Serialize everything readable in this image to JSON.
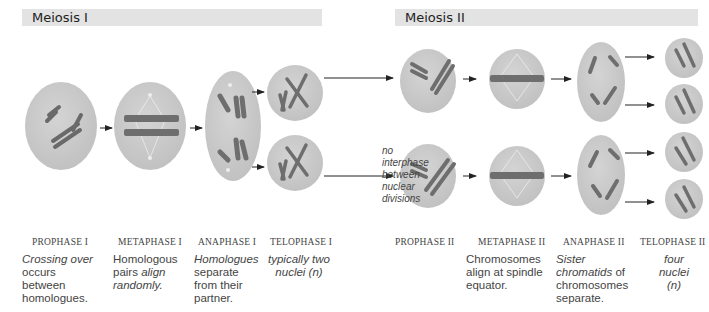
{
  "sections": {
    "meiosis1": {
      "title": "Meiosis I"
    },
    "meiosis2": {
      "title": "Meiosis II"
    }
  },
  "note": {
    "lines": [
      "no",
      "interphase",
      "between",
      "nuclear",
      "divisions"
    ]
  },
  "phases": [
    {
      "name": "PROPHASE I",
      "desc": [
        {
          "t": "Crossing over",
          "i": true
        },
        {
          "t": " occurs between homologues.",
          "i": false
        }
      ]
    },
    {
      "name": "METAPHASE I",
      "desc": [
        {
          "t": "Homologous pairs ",
          "i": false
        },
        {
          "t": "align randomly.",
          "i": true
        }
      ]
    },
    {
      "name": "ANAPHASE I",
      "desc": [
        {
          "t": "Homologues",
          "i": true
        },
        {
          "t": " separate from their partner.",
          "i": false
        }
      ]
    },
    {
      "name": "TELOPHASE I",
      "desc": [
        {
          "t": "typically two nuclei (n)",
          "i": true
        }
      ]
    },
    {
      "name": "PROPHASE II",
      "desc": []
    },
    {
      "name": "METAPHASE II",
      "desc": [
        {
          "t": "Chromosomes align at spindle equator.",
          "i": false
        }
      ]
    },
    {
      "name": "ANAPHASE II",
      "desc": [
        {
          "t": "Sister chromatids",
          "i": true
        },
        {
          "t": " of chromosomes separate.",
          "i": false
        }
      ]
    },
    {
      "name": "TELOPHASE II",
      "desc": [
        {
          "t": "four nuclei (n)",
          "i": true
        }
      ]
    }
  ],
  "colors": {
    "cell_fill": "#c9c9c9",
    "chromosome": "#6e6e6e",
    "banner": "#e3e3e3",
    "text": "#444444"
  }
}
